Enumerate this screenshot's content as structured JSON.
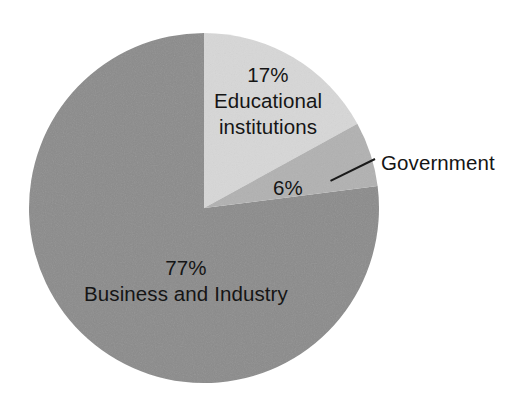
{
  "chart_data": {
    "type": "pie",
    "title": "",
    "subtitle": "",
    "xlabel": "",
    "ylabel": "",
    "legend_position": "none",
    "grid": false,
    "units": "percent",
    "start_angle_deg": 0,
    "direction": "clockwise",
    "categories": [
      "Educational institutions",
      "Government",
      "Business and Industry"
    ],
    "values": [
      17,
      6,
      77
    ],
    "labels": [
      "17%",
      "6%",
      "77%"
    ],
    "colors": [
      "#d7d7d7",
      "#b1b1b1",
      "#8b8b8b"
    ],
    "slices": [
      {
        "name": "Educational institutions",
        "value": 17,
        "percent_label": "17%",
        "color": "#d7d7d7",
        "label_placement": "inside",
        "leader_line": false
      },
      {
        "name": "Government",
        "value": 6,
        "percent_label": "6%",
        "color": "#b1b1b1",
        "label_placement": "outside",
        "leader_line": true
      },
      {
        "name": "Business and Industry",
        "value": 77,
        "percent_label": "77%",
        "color": "#8b8b8b",
        "label_placement": "inside",
        "leader_line": false
      }
    ]
  },
  "geometry": {
    "center_x": 204,
    "center_y": 208,
    "radius": 175
  },
  "labels": {
    "educational": {
      "percent": "17%",
      "line1": "Educational",
      "line2": "institutions"
    },
    "government": {
      "name": "Government"
    },
    "six": {
      "percent": "6%"
    },
    "business": {
      "percent": "77%",
      "name": "Business and Industry"
    }
  },
  "colors": {
    "slice_educational": "#d7d7d7",
    "slice_government": "#b1b1b1",
    "slice_business": "#8b8b8b",
    "text": "#151515",
    "leader_line": "#1a1a1a",
    "background": "#ffffff"
  }
}
